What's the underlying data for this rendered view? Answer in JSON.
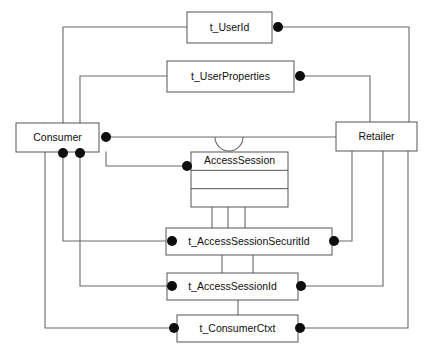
{
  "diagram": {
    "type": "uml-class-diagram",
    "canvas": {
      "width": 429,
      "height": 355
    },
    "colors": {
      "background": "#ffffff",
      "node_fill": "#ffffff",
      "node_stroke": "#555555",
      "link_stroke": "#6a6a6a",
      "endpoint_dot": "#0d0d0d",
      "label_text": "#101010"
    },
    "nodes": [
      {
        "id": "t_UserId",
        "label": "t_UserId",
        "kind": "type-box",
        "x": 187,
        "y": 12,
        "w": 85,
        "h": 31,
        "compartments": 1
      },
      {
        "id": "t_UserProperties",
        "label": "t_UserProperties",
        "kind": "type-box",
        "x": 167,
        "y": 61,
        "w": 127,
        "h": 31,
        "compartments": 1
      },
      {
        "id": "Consumer",
        "label": "Consumer",
        "kind": "actor-box",
        "x": 16,
        "y": 123,
        "w": 83,
        "h": 29,
        "compartments": 1
      },
      {
        "id": "Retailer",
        "label": "Retailer",
        "kind": "actor-box",
        "x": 336,
        "y": 122,
        "w": 81,
        "h": 29,
        "compartments": 1
      },
      {
        "id": "AccessSession",
        "label": "AccessSession",
        "kind": "class-box",
        "x": 191,
        "y": 152,
        "w": 97,
        "h": 55,
        "compartments": 3
      },
      {
        "id": "t_AccessSessionSecuritId",
        "label": "t_AccessSessionSecuritId",
        "kind": "type-box",
        "x": 166,
        "y": 228,
        "w": 166,
        "h": 27,
        "compartments": 1
      },
      {
        "id": "t_AccessSessionId",
        "label": "t_AccessSessionId",
        "kind": "type-box",
        "x": 167,
        "y": 273,
        "w": 131,
        "h": 27,
        "compartments": 1
      },
      {
        "id": "t_ConsumerCtxt",
        "label": "t_ConsumerCtxt",
        "kind": "type-box",
        "x": 177,
        "y": 315,
        "w": 121,
        "h": 27,
        "compartments": 1
      }
    ],
    "endpoint_dots": [
      {
        "name": "dot-t_UserId-right",
        "x": 278,
        "y": 27,
        "r": 5.0
      },
      {
        "name": "dot-t_UserProperties-right",
        "x": 300,
        "y": 76,
        "r": 5.0
      },
      {
        "name": "dot-consumer-right",
        "x": 106,
        "y": 137,
        "r": 5.0
      },
      {
        "name": "dot-consumer-bottom-left",
        "x": 63,
        "y": 153,
        "r": 5.0
      },
      {
        "name": "dot-consumer-bottom-right",
        "x": 80,
        "y": 153,
        "r": 5.0
      },
      {
        "name": "dot-accesssession-left",
        "x": 187,
        "y": 166,
        "r": 5.0
      },
      {
        "name": "dot-securitid-left",
        "x": 172,
        "y": 241,
        "r": 5.0
      },
      {
        "name": "dot-securitid-right",
        "x": 334,
        "y": 241,
        "r": 5.0
      },
      {
        "name": "dot-sessionid-left",
        "x": 172,
        "y": 286,
        "r": 5.0
      },
      {
        "name": "dot-sessionid-right",
        "x": 301,
        "y": 286,
        "r": 5.0
      },
      {
        "name": "dot-consumerctxt-left",
        "x": 174,
        "y": 328,
        "r": 5.0
      },
      {
        "name": "dot-consumerctxt-right",
        "x": 300,
        "y": 328,
        "r": 5.0
      }
    ],
    "links": [
      {
        "name": "link-consumer-to-userid",
        "d": "M 63 123 L 63 27 L 187 27"
      },
      {
        "name": "link-userid-to-retailer",
        "d": "M 278 27 L 409 27 L 409 122"
      },
      {
        "name": "link-consumer-to-userproperties",
        "d": "M 80 123 L 80 76 L 167 76"
      },
      {
        "name": "link-userproperties-to-retailer",
        "d": "M 300 76 L 370 76 L 370 122"
      },
      {
        "name": "link-consumer-to-retailer",
        "d": "M 106 137 L 336 137"
      },
      {
        "name": "link-consumer-to-accesssession",
        "d": "M 106 152 L 106 166 L 187 166"
      },
      {
        "name": "link-accesssession-to-securitid-a",
        "d": "M 212 207 L 212 228"
      },
      {
        "name": "link-accesssession-to-securitid-b",
        "d": "M 228 207 L 228 228"
      },
      {
        "name": "link-accesssession-to-securitid-c",
        "d": "M 245 207 L 245 228"
      },
      {
        "name": "link-consumer-b1-to-securitid",
        "d": "M 63 153 L 63 241 L 166 241"
      },
      {
        "name": "link-securitid-to-retailer",
        "d": "M 334 241 L 352 241 L 352 151"
      },
      {
        "name": "link-securitid-to-sessionid-a",
        "d": "M 222 255 L 222 273"
      },
      {
        "name": "link-securitid-to-sessionid-b",
        "d": "M 253 255 L 253 273"
      },
      {
        "name": "link-consumer-b2-to-sessionid",
        "d": "M 80 153 L 80 286 L 167 286"
      },
      {
        "name": "link-sessionid-to-retailer",
        "d": "M 301 286 L 383 286 L 383 151"
      },
      {
        "name": "link-sessionid-to-consumerctxt",
        "d": "M 238 300 L 238 315"
      },
      {
        "name": "link-consumer-left-to-consumerctxt",
        "d": "M 45 123 L 45 328 L 177 328"
      },
      {
        "name": "link-consumerctxt-to-retailer",
        "d": "M 300 328 L 408 328 L 408 151"
      }
    ],
    "line_jumps": [
      {
        "name": "line-jump-accesssession-top",
        "cx": 229,
        "cy": 137,
        "r": 14
      }
    ]
  }
}
